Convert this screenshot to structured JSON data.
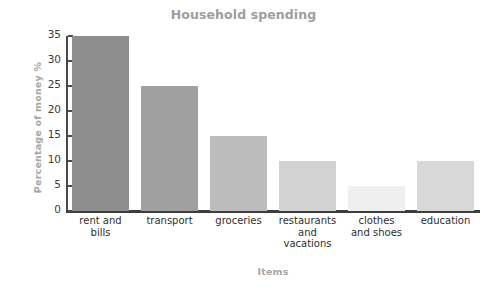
{
  "chart_data": {
    "type": "bar",
    "title": "Household spending",
    "xlabel": "Items",
    "ylabel": "Percentage of money %",
    "categories": [
      "rent and bills",
      "transport",
      "groceries",
      "restaurants and vacations",
      "clothes and shoes",
      "education"
    ],
    "category_lines": [
      [
        "rent and",
        "bills"
      ],
      [
        "transport"
      ],
      [
        "groceries"
      ],
      [
        "restaurants",
        "and",
        "vacations"
      ],
      [
        "clothes",
        "and shoes"
      ],
      [
        "education"
      ]
    ],
    "values": [
      35,
      25,
      15,
      10,
      5,
      10
    ],
    "ylim": [
      0,
      35
    ],
    "yticks": [
      0,
      5,
      10,
      15,
      20,
      25,
      30,
      35
    ],
    "ytick_labels": [
      "0",
      "5",
      "10",
      "15",
      "20",
      "25",
      "30",
      "35"
    ],
    "grid": false,
    "legend": "none",
    "bar_colors": [
      "#8d8d8d",
      "#a0a0a0",
      "#bcbcbc",
      "#d2d2d2",
      "#efefef",
      "#d8d8d8"
    ],
    "title_color": "#9d9d9d",
    "axis_title_color": "#a6a6a6",
    "axis_line_color": "#3d3d3d",
    "tick_label_color": "#3a3a3a",
    "category_label_color": "#2e2e2e"
  }
}
